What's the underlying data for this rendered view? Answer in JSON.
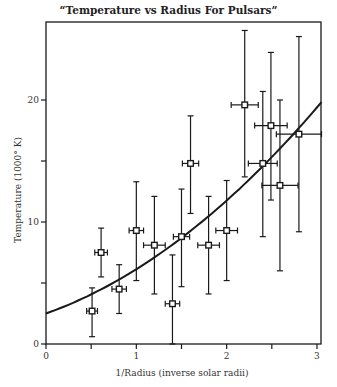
{
  "chart_data": {
    "type": "scatter",
    "title": "“Temperature vs Radius For Pulsars”",
    "xlabel": "1/Radius (inverse solar radii)",
    "ylabel": "Temperature (1000° K)",
    "xlim": [
      0,
      3.05
    ],
    "ylim": [
      0,
      26.4
    ],
    "x_ticks": [
      0,
      0.5,
      1,
      1.5,
      2,
      2.5,
      3
    ],
    "x_tick_labels": [
      "0",
      "",
      "1",
      "",
      "2",
      "",
      "3"
    ],
    "y_ticks": [
      0,
      5,
      10,
      15,
      20
    ],
    "y_tick_labels": [
      "0",
      "",
      "10",
      "",
      "20"
    ],
    "grid": false,
    "legend": null,
    "series": [
      {
        "name": "Pulsars",
        "marker": "open-square",
        "points": [
          {
            "x": 0.51,
            "y": 2.7,
            "xerr": 0.06,
            "y_low": 0.6,
            "y_high": 4.6
          },
          {
            "x": 0.61,
            "y": 7.5,
            "xerr": 0.07,
            "y_low": 5.5,
            "y_high": 9.5
          },
          {
            "x": 0.81,
            "y": 4.5,
            "xerr": 0.08,
            "y_low": 2.5,
            "y_high": 6.5
          },
          {
            "x": 1.0,
            "y": 9.3,
            "xerr": 0.08,
            "y_low": 5.2,
            "y_high": 13.3
          },
          {
            "x": 1.2,
            "y": 8.1,
            "xerr": 0.12,
            "y_low": 4.1,
            "y_high": 12.1
          },
          {
            "x": 1.4,
            "y": 3.3,
            "xerr": 0.08,
            "y_low": 0.0,
            "y_high": 7.3
          },
          {
            "x": 1.5,
            "y": 8.8,
            "xerr": 0.09,
            "y_low": 4.7,
            "y_high": 12.7
          },
          {
            "x": 1.6,
            "y": 14.8,
            "xerr": 0.09,
            "y_low": 10.7,
            "y_high": 18.7
          },
          {
            "x": 1.8,
            "y": 8.1,
            "xerr": 0.12,
            "y_low": 4.1,
            "y_high": 12.1
          },
          {
            "x": 2.0,
            "y": 9.3,
            "xerr": 0.12,
            "y_low": 5.2,
            "y_high": 13.4
          },
          {
            "x": 2.2,
            "y": 19.6,
            "xerr": 0.15,
            "y_low": 13.7,
            "y_high": 25.7
          },
          {
            "x": 2.4,
            "y": 14.8,
            "xerr": 0.16,
            "y_low": 8.8,
            "y_high": 20.7
          },
          {
            "x": 2.49,
            "y": 17.9,
            "xerr": 0.18,
            "y_low": 11.8,
            "y_high": 23.9
          },
          {
            "x": 2.59,
            "y": 13.0,
            "xerr": 0.2,
            "y_low": 6.0,
            "y_high": 20.0
          },
          {
            "x": 2.8,
            "y": 17.2,
            "xerr": 0.25,
            "y_low": 9.2,
            "y_high": 25.2
          }
        ]
      }
    ],
    "fit_curve": {
      "name": "Fit",
      "form": "quadratic",
      "coefficients": {
        "c0": 2.5,
        "c1": 2.63,
        "c2": 1.0
      },
      "x_range": [
        0,
        3.05
      ]
    }
  },
  "labels": {
    "title": "“Temperature vs Radius For Pulsars”",
    "xlabel": "1/Radius (inverse solar radii)",
    "ylabel": "Temperature (1000° K)"
  },
  "colors": {
    "ink": "#1a1a1a",
    "background": "#ffffff"
  }
}
